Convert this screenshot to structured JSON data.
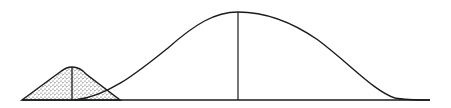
{
  "diagram": {
    "colors": {
      "stroke": "#1a1a1a",
      "background": "#ffffff",
      "stipple": "#333333"
    },
    "baseline": {
      "x1": 22,
      "x2": 430,
      "y": 100
    },
    "small_distribution": {
      "shaded": true,
      "fill": "stippled",
      "left_foot_x": 22,
      "peak_x": 72,
      "peak_y": 68,
      "right_foot_x": 120,
      "has_mean_line": true
    },
    "large_distribution": {
      "shaded": false,
      "left_start_x": 75,
      "peak_x": 238,
      "peak_y": 12,
      "right_end_x": 430,
      "has_mean_line": true
    }
  }
}
